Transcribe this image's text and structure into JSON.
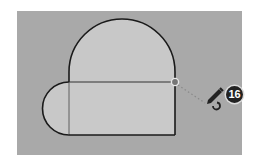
{
  "scene": {
    "background_color": "#a9a9a9",
    "face_color": "#c8c8c8",
    "edge_color": "#1a1a1a",
    "inference_point_color": "#777777"
  },
  "cursor": {
    "tool": "pencil-arc-icon",
    "step_badge": "16"
  }
}
